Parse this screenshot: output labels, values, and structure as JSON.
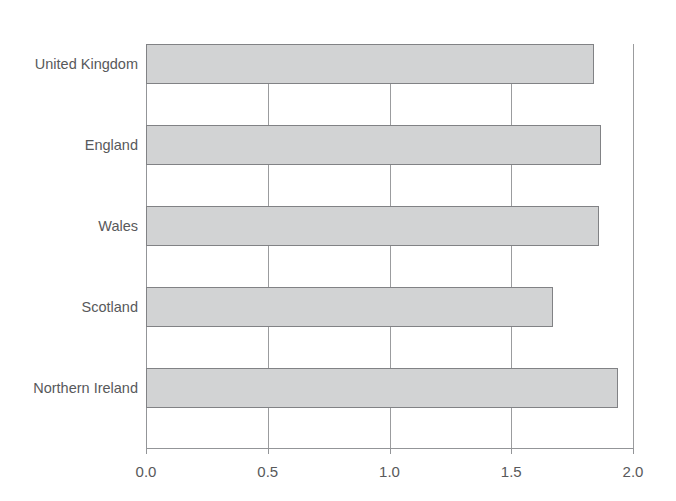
{
  "figure": {
    "ghost_title": "",
    "background_color": "#ffffff",
    "bar_fill_color": "#d2d3d4",
    "bar_stroke_color": "#818285",
    "axis_color": "#939598",
    "text_color": "#58595b"
  },
  "chart_data": {
    "type": "bar",
    "orientation": "horizontal",
    "title": "",
    "subtitle": "",
    "xlabel": "",
    "ylabel": "",
    "categories": [
      "United Kingdom",
      "England",
      "Wales",
      "Scotland",
      "Northern Ireland"
    ],
    "values": [
      1.84,
      1.87,
      1.86,
      1.67,
      1.94
    ],
    "xlim": [
      0.0,
      2.0
    ],
    "xticks": [
      0.0,
      0.5,
      1.0,
      1.5,
      2.0
    ],
    "xtick_labels": [
      "0.0",
      "0.5",
      "1.0",
      "1.5",
      "2.0"
    ],
    "grid": "vertical",
    "legend": null,
    "legend_position": "none",
    "annotations": []
  }
}
